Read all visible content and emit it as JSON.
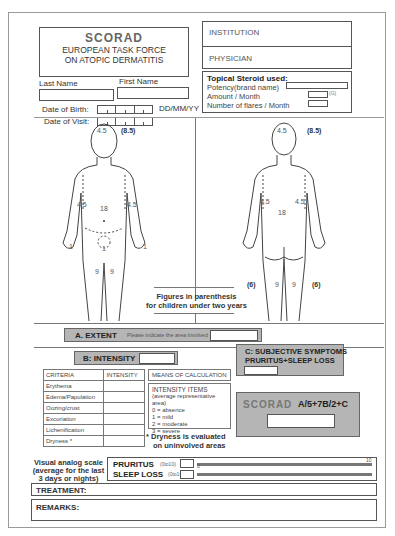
{
  "header": {
    "title": "SCORAD",
    "subtitle_line1": "EUROPEAN TASK FORCE",
    "subtitle_line2": "ON ATOPIC DERMATITIS"
  },
  "patient": {
    "last_name_label": "Last Name",
    "first_name_label": "First Name",
    "last_name_value": "",
    "first_name_value": "",
    "dob_label": "Date of Birth:",
    "dov_label": "Date of Visit:",
    "date_format": "DD/MM/YY"
  },
  "institution": {
    "institution_label": "INSTITUTION",
    "physician_label": "PHYSICIAN"
  },
  "steroid": {
    "title": "Topical Steroid used:",
    "potency_label": "Potency(brand name)",
    "amount_label": "Amount / Month",
    "amount_unit": "(G)",
    "flares_label": "Number of flares / Month"
  },
  "body_figures": {
    "front": {
      "head": "4.5",
      "head_child": "(8.5)",
      "arm_left": "4.5",
      "arm_right": "4.5",
      "trunk": "18",
      "hand_left": "1",
      "hand_right": "1",
      "genital": "1",
      "leg_left": "9",
      "leg_right": "9"
    },
    "back": {
      "head": "4.5",
      "head_child": "(8.5)",
      "arm_left": "4.5",
      "arm_right": "4.5",
      "trunk": "18",
      "leg_left": "9",
      "leg_right": "9",
      "leg_left_child": "(6)",
      "leg_right_child": "(6)"
    },
    "note_line1": "Figures in parenthesis",
    "note_line2": "for children under two years"
  },
  "extent": {
    "label": "A. EXTENT",
    "hint": "Please indicate the area involved",
    "value": ""
  },
  "intensity": {
    "label": "B: INTENSITY",
    "value": "",
    "table_headers": [
      "CRITERIA",
      "INTENSITY"
    ],
    "criteria": [
      "Erythema",
      "Edema/Papulation",
      "Oozing/crust",
      "Excoriation",
      "Lichenification",
      "Dryness *"
    ],
    "means_title": "MEANS OF CALCULATION",
    "means_items_title": "INTENSITY ITEMS",
    "means_items_sub": "(average representative area)",
    "scale": [
      "0 = absence",
      "1 = mild",
      "2 = moderate",
      "3 = severe"
    ],
    "dryness_note_line1": "* Dryness is evaluated",
    "dryness_note_line2": "on uninvolved areas"
  },
  "subjective": {
    "label_line1": "C: SUBJECTIVE SYMPTOMS",
    "label_line2": "PRURITUS+SLEEP LOSS",
    "value": ""
  },
  "scorad_formula": {
    "label": "SCORAD",
    "formula": "A/5+7B/2+C",
    "value": ""
  },
  "vas": {
    "label_line1": "Visual analog scale",
    "label_line2": "(average for the last",
    "label_line3": "3 days or nights)",
    "pruritus_label": "PRURITUS",
    "sleep_label": "SLEEP LOSS",
    "range_hint": "(0to10)",
    "min": "0",
    "max": "10"
  },
  "treatment_label": "TREATMENT:",
  "remarks_label": "REMARKS:",
  "colors": {
    "panel_gray": "#b5b5b5",
    "border": "#555555"
  }
}
